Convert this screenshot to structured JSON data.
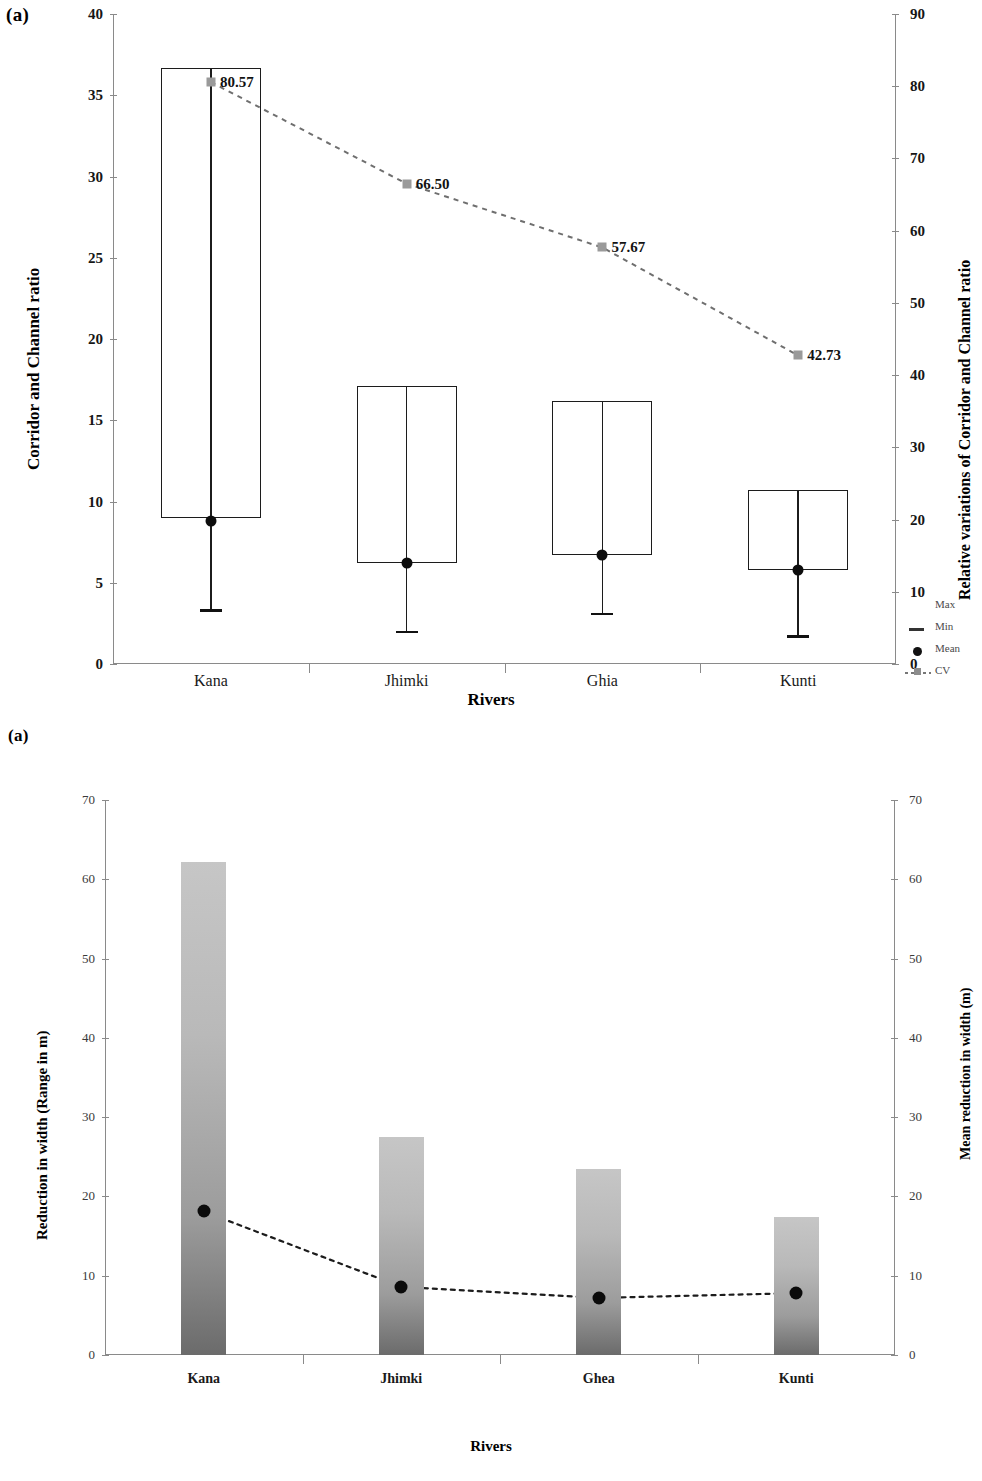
{
  "figure": {
    "panels": [
      {
        "tag": "(a)"
      },
      {
        "tag": "(a)"
      }
    ]
  },
  "chart_a": {
    "tag": "(a)",
    "xlabel": "Rivers",
    "ylabel_left": "Corridor and Channel ratio",
    "ylabel_right": "Relative variations of Corridor and Channel ratio",
    "categories": [
      "Kana",
      "Jhimki",
      "Ghia",
      "Kunti"
    ],
    "yticks_left": [
      "0",
      "5",
      "10",
      "15",
      "20",
      "25",
      "30",
      "35",
      "40"
    ],
    "yticks_right": [
      "0",
      "10",
      "20",
      "30",
      "40",
      "50",
      "60",
      "70",
      "80",
      "90"
    ],
    "cv_labels": [
      "80.57",
      "66.50",
      "57.67",
      "42.73"
    ],
    "legend": [
      {
        "label": "Max",
        "symbol": "box-outline-icon"
      },
      {
        "label": "Min",
        "symbol": "dash-icon"
      },
      {
        "label": "Mean",
        "symbol": "filled-circle-icon"
      },
      {
        "label": "CV",
        "symbol": "dashed-line-square-icon"
      }
    ]
  },
  "chart_b": {
    "tag": "(a)",
    "xlabel": "Rivers",
    "ylabel_left": "Reduction in width (Range in m)",
    "ylabel_right": "Mean reduction in width (m)",
    "categories": [
      "Kana",
      "Jhimki",
      "Ghea",
      "Kunti"
    ],
    "yticks_left": [
      "0",
      "10",
      "20",
      "30",
      "40",
      "50",
      "60",
      "70"
    ],
    "yticks_right": [
      "0",
      "10",
      "20",
      "30",
      "40",
      "50",
      "60",
      "70"
    ]
  },
  "chart_data": [
    {
      "type": "bar",
      "subtype": "box-range-with-mean-and-cv-line",
      "title": "(a) Corridor and Channel ratio by river",
      "xlabel": "Rivers",
      "ylabel": "Corridor and Channel ratio",
      "ylabel_secondary": "Relative variations of Corridor and Channel ratio",
      "categories": [
        "Kana",
        "Jhimki",
        "Ghia",
        "Kunti"
      ],
      "ylim": [
        0,
        40
      ],
      "ylim_secondary": [
        0,
        90
      ],
      "ytick_step": 5,
      "ytick_step_secondary": 10,
      "grid": false,
      "legend": [
        "Max",
        "Min",
        "Mean",
        "CV"
      ],
      "legend_position": "right",
      "series": [
        {
          "name": "Max",
          "axis": "left",
          "values": [
            36.7,
            17.1,
            16.2,
            10.7
          ]
        },
        {
          "name": "Box bottom",
          "axis": "left",
          "values": [
            9.0,
            6.2,
            6.7,
            5.8
          ]
        },
        {
          "name": "Min",
          "axis": "left",
          "values": [
            3.3,
            2.0,
            3.1,
            1.7
          ]
        },
        {
          "name": "Mean",
          "axis": "left",
          "values": [
            8.8,
            6.2,
            6.7,
            5.8
          ]
        },
        {
          "name": "CV",
          "axis": "right",
          "values": [
            80.57,
            66.5,
            57.67,
            42.73
          ]
        }
      ],
      "annotations": [
        "80.57",
        "66.50",
        "57.67",
        "42.73"
      ]
    },
    {
      "type": "bar",
      "subtype": "gradient-bars-with-mean-line",
      "title": "(a) Reduction in width by river",
      "xlabel": "Rivers",
      "ylabel": "Reduction in width (Range in m)",
      "ylabel_secondary": "Mean reduction in width (m)",
      "categories": [
        "Kana",
        "Jhimki",
        "Ghea",
        "Kunti"
      ],
      "ylim": [
        0,
        70
      ],
      "ylim_secondary": [
        0,
        70
      ],
      "ytick_step": 10,
      "ytick_step_secondary": 10,
      "grid": false,
      "legend": [],
      "series": [
        {
          "name": "Reduction in width (Range in m)",
          "axis": "left",
          "values": [
            62.2,
            27.5,
            23.4,
            17.4
          ]
        },
        {
          "name": "Mean reduction in width (m)",
          "axis": "right",
          "values": [
            18.1,
            8.6,
            7.2,
            7.8
          ]
        }
      ]
    }
  ],
  "colors": {
    "bar_top": "#c6c6c6",
    "bar_bottom": "#6b6b6b",
    "axis": "#8a8a8a",
    "line": "#1c1c1c",
    "cv_marker": "#9a9a9a",
    "mean_dot": "#0b0b0b"
  }
}
